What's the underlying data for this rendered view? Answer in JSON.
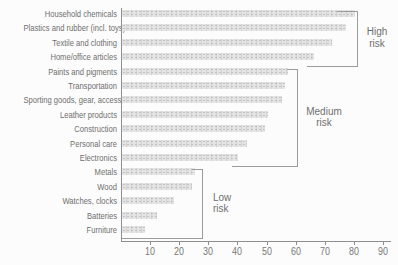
{
  "chart_data": {
    "type": "bar",
    "orientation": "horizontal",
    "title": "",
    "xlabel": "",
    "ylabel": "",
    "xlim": [
      0,
      90
    ],
    "x_ticks": [
      10,
      20,
      30,
      40,
      50,
      60,
      70,
      80,
      90
    ],
    "grid": false,
    "legend": "none",
    "bar_color": "#e4e4e4",
    "axis_color": "#8f8f8f",
    "text_color": "#6f6f6f",
    "categories": [
      "Household chemicals",
      "Plastics and rubber (incl. toys)",
      "Textile and clothing",
      "Home/office articles",
      "Paints and pigments",
      "Transportation",
      "Sporting goods, gear, accessories",
      "Leather products",
      "Construction",
      "Personal care",
      "Electronics",
      "Metals",
      "Wood",
      "Watches, clocks",
      "Batteries",
      "Furniture"
    ],
    "values": [
      80,
      77,
      72,
      66,
      57,
      56,
      55,
      50,
      49,
      43,
      40,
      25,
      24,
      18,
      12,
      8
    ],
    "groups": [
      {
        "name": "High risk",
        "lines": [
          "High",
          "risk"
        ],
        "rows": [
          0,
          3
        ]
      },
      {
        "name": "Medium risk",
        "lines": [
          "Medium",
          "risk"
        ],
        "rows": [
          4,
          10
        ]
      },
      {
        "name": "Low risk",
        "lines": [
          "Low",
          "risk"
        ],
        "rows": [
          11,
          15
        ]
      }
    ]
  }
}
